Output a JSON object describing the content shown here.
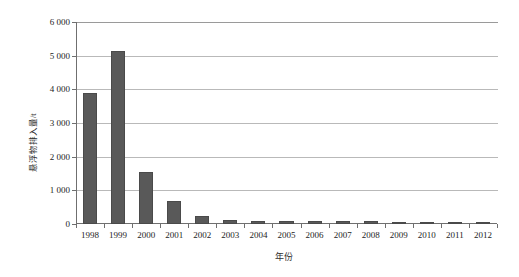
{
  "chart_data": {
    "type": "bar",
    "title": "",
    "xlabel": "年份",
    "ylabel": "悬浮物排入量/t",
    "categories": [
      "1998",
      "1999",
      "2000",
      "2001",
      "2002",
      "2003",
      "2004",
      "2005",
      "2006",
      "2007",
      "2008",
      "2009",
      "2010",
      "2011",
      "2012"
    ],
    "values": [
      3900,
      5130,
      1550,
      670,
      250,
      110,
      95,
      90,
      85,
      100,
      80,
      60,
      50,
      40,
      30
    ],
    "ylim": [
      0,
      6000
    ],
    "ytick_labels": [
      "0",
      "1 000",
      "2 000",
      "3 000",
      "4 000",
      "5 000",
      "6 000"
    ],
    "ytick_values": [
      0,
      1000,
      2000,
      3000,
      4000,
      5000,
      6000
    ],
    "grid": true,
    "legend": "none",
    "series_color": "#595959"
  }
}
